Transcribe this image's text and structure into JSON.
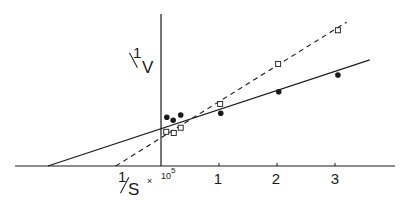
{
  "chart_data": {
    "type": "scatter",
    "title": "",
    "xlabel": "1/S",
    "xlabel_multiplier": "× 10^5",
    "ylabel": "1/V",
    "x_ticks": [
      1,
      2,
      3
    ],
    "xlim": [
      -2.5,
      4.0
    ],
    "ylim": [
      0,
      2.85
    ],
    "grid": false,
    "legend": null,
    "series": [
      {
        "name": "filled circles",
        "marker": "filled-circle",
        "line": "solid",
        "points": [
          [
            0.1,
            0.84
          ],
          [
            0.21,
            0.79
          ],
          [
            0.34,
            0.88
          ],
          [
            1.03,
            0.91
          ],
          [
            2.03,
            1.28
          ],
          [
            3.05,
            1.57
          ]
        ],
        "fit_line": {
          "x_intercept": -1.95,
          "y_intercept": 0.63,
          "x_end": 3.6,
          "y_end": 1.83
        }
      },
      {
        "name": "open squares",
        "marker": "open-square",
        "line": "dashed",
        "points": [
          [
            0.09,
            0.59
          ],
          [
            0.22,
            0.57
          ],
          [
            0.34,
            0.66
          ],
          [
            1.02,
            1.07
          ],
          [
            2.02,
            1.76
          ],
          [
            3.05,
            2.34
          ]
        ],
        "fit_line": {
          "x_intercept": -0.78,
          "y_intercept": 0.48,
          "x_end": 3.2,
          "y_end": 2.48
        }
      }
    ]
  },
  "labels": {
    "y_axis_numerator": "1",
    "y_axis_denominator": "V",
    "x_axis_numerator": "1",
    "x_axis_denominator": "S",
    "x_multiplier_times": "×",
    "x_multiplier_base": "10",
    "x_multiplier_exp": "5",
    "tick_1": "1",
    "tick_2": "2",
    "tick_3": "3"
  },
  "colors": {
    "ink": "#1a1a1a",
    "background": "#ffffff"
  }
}
